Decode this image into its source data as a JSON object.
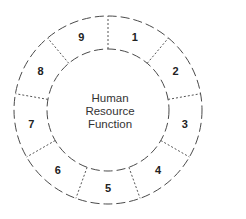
{
  "diagram": {
    "type": "segmented-ring",
    "center_label": {
      "lines": [
        "Human",
        "Resource",
        "Function"
      ]
    },
    "segments": [
      {
        "label": "1"
      },
      {
        "label": "2"
      },
      {
        "label": "3"
      },
      {
        "label": "4"
      },
      {
        "label": "5"
      },
      {
        "label": "6"
      },
      {
        "label": "7"
      },
      {
        "label": "8"
      },
      {
        "label": "9"
      }
    ],
    "colors": {
      "stroke": "#4a4a4a",
      "divider": "#555555",
      "text": "#222222",
      "background": "#ffffff"
    }
  }
}
